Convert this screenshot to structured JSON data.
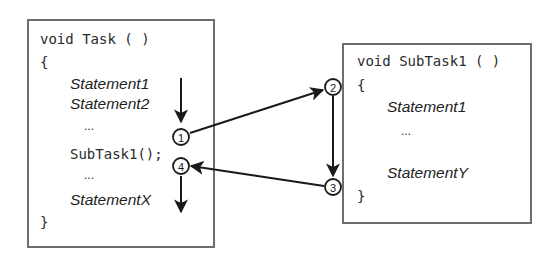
{
  "diagram": {
    "type": "control-flow",
    "task_box": {
      "signature": "void Task ( )",
      "open_brace": "{",
      "lines": [
        {
          "text": "Statement1",
          "style": "italic"
        },
        {
          "text": "Statement2",
          "style": "italic"
        },
        {
          "text": "...",
          "style": "ellipsis"
        },
        {
          "text": "SubTask1();",
          "style": "code"
        },
        {
          "text": "...",
          "style": "ellipsis"
        },
        {
          "text": "StatementX",
          "style": "italic"
        }
      ],
      "close_brace": "}"
    },
    "subtask_box": {
      "signature": "void SubTask1 ( )",
      "open_brace": "{",
      "lines": [
        {
          "text": "Statement1",
          "style": "italic"
        },
        {
          "text": "...",
          "style": "ellipsis"
        },
        {
          "text": "StatementY",
          "style": "italic"
        }
      ],
      "close_brace": "}"
    },
    "steps": [
      {
        "id": "1",
        "label": "1"
      },
      {
        "id": "2",
        "label": "2"
      },
      {
        "id": "3",
        "label": "3"
      },
      {
        "id": "4",
        "label": "4"
      }
    ],
    "edges": [
      {
        "from": "Statement1",
        "to": "step-1",
        "kind": "sequential"
      },
      {
        "from": "step-1",
        "to": "step-2",
        "kind": "call"
      },
      {
        "from": "step-2",
        "to": "step-3",
        "kind": "sequential"
      },
      {
        "from": "step-3",
        "to": "step-4",
        "kind": "return"
      },
      {
        "from": "step-4",
        "to": "StatementX",
        "kind": "sequential"
      }
    ],
    "colors": {
      "box_border": "#6e6e6e",
      "ink": "#1a1a1a",
      "background": "#ffffff"
    }
  }
}
